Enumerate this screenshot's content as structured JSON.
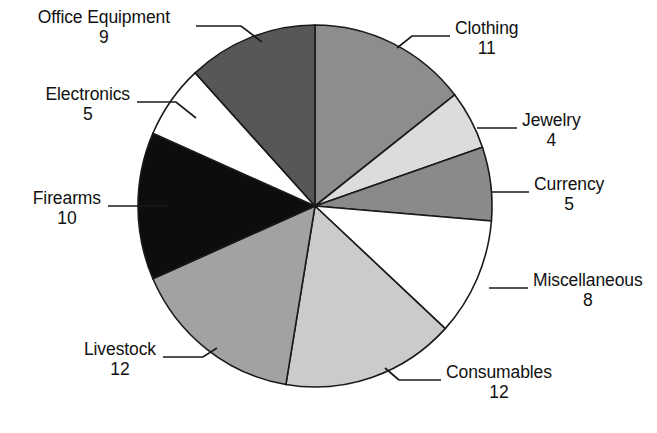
{
  "chart_data": {
    "type": "pie",
    "title": "",
    "subtitle": "",
    "xlabel": "",
    "ylabel": "",
    "legend_position": "none",
    "grid": false,
    "total": 76,
    "start_angle_deg": 0,
    "direction": "clockwise",
    "categories": [
      "Clothing",
      "Jewelry",
      "Currency",
      "Miscellaneous",
      "Consumables",
      "Livestock",
      "Firearms",
      "Electronics",
      "Office Equipment"
    ],
    "values": [
      11,
      4,
      5,
      8,
      12,
      12,
      10,
      5,
      9
    ],
    "slices": [
      {
        "label": "Clothing",
        "value": 11,
        "color": "#8d8d8d"
      },
      {
        "label": "Jewelry",
        "value": 4,
        "color": "#dcdcdc"
      },
      {
        "label": "Currency",
        "value": 5,
        "color": "#8a8a8a"
      },
      {
        "label": "Miscellaneous",
        "value": 8,
        "color": "#ffffff"
      },
      {
        "label": "Consumables",
        "value": 12,
        "color": "#cbcbcb"
      },
      {
        "label": "Livestock",
        "value": 12,
        "color": "#a2a2a2"
      },
      {
        "label": "Firearms",
        "value": 10,
        "color": "#0d0d0d"
      },
      {
        "label": "Electronics",
        "value": 5,
        "color": "#ffffff"
      },
      {
        "label": "Office Equipment",
        "value": 9,
        "color": "#575757"
      }
    ]
  },
  "labels": {
    "office_equipment": {
      "name": "Office Equipment",
      "value": "9"
    },
    "electronics": {
      "name": "Electronics",
      "value": "5"
    },
    "firearms": {
      "name": "Firearms",
      "value": "10"
    },
    "livestock": {
      "name": "Livestock",
      "value": "12"
    },
    "consumables": {
      "name": "Consumables",
      "value": "12"
    },
    "miscellaneous": {
      "name": "Miscellaneous",
      "value": "8"
    },
    "currency": {
      "name": "Currency",
      "value": "5"
    },
    "jewelry": {
      "name": "Jewelry",
      "value": "4"
    },
    "clothing": {
      "name": "Clothing",
      "value": "11"
    }
  },
  "colors": {
    "background": "#ffffff",
    "outline": "#1a1a1a",
    "text": "#111111"
  }
}
